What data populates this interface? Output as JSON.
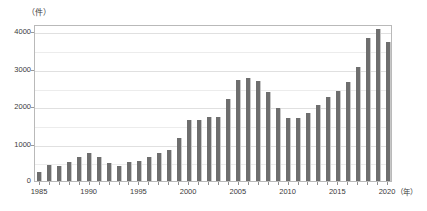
{
  "chart_data": {
    "type": "bar",
    "title": "",
    "subtitle": "",
    "xlabel": "年",
    "ylabel": "件",
    "y_unit_label": "（件）",
    "x_unit_label": "（年）",
    "categories": [
      "1985",
      "1986",
      "1987",
      "1988",
      "1989",
      "1990",
      "1991",
      "1992",
      "1993",
      "1994",
      "1995",
      "1996",
      "1997",
      "1998",
      "1999",
      "2000",
      "2001",
      "2002",
      "2003",
      "2004",
      "2005",
      "2006",
      "2007",
      "2008",
      "2009",
      "2010",
      "2011",
      "2012",
      "2013",
      "2014",
      "2015",
      "2016",
      "2017",
      "2018",
      "2019",
      "2020"
    ],
    "values": [
      250,
      420,
      390,
      520,
      640,
      750,
      630,
      490,
      400,
      510,
      530,
      630,
      760,
      820,
      1150,
      1620,
      1640,
      1720,
      1700,
      2190,
      2710,
      2750,
      2680,
      2380,
      1940,
      1690,
      1680,
      1830,
      2030,
      2250,
      2410,
      2640,
      3040,
      3830,
      4080,
      3710
    ],
    "ylim": [
      0,
      4200
    ],
    "yticks": [
      0,
      1000,
      2000,
      3000,
      4000
    ],
    "ytick_labels": [
      "0",
      "1000",
      "2000",
      "3000",
      "4000"
    ],
    "y_gridlines": [
      500,
      1000,
      1500,
      2000,
      2500,
      3000,
      3500,
      4000
    ],
    "xticks": [
      "1985",
      "1990",
      "1995",
      "2000",
      "2005",
      "2010",
      "2015",
      "2020"
    ],
    "grid": true,
    "legend": false,
    "legend_position": "none",
    "bar_color": "#6e6e6e",
    "frame_color": "#b9b9b9",
    "gridline_color": "#ececec"
  }
}
